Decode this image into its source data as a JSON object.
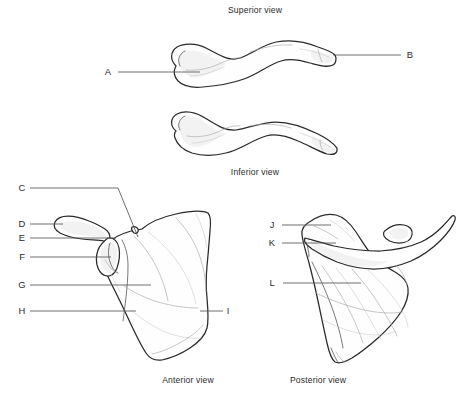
{
  "figure": {
    "background_color": "#ffffff",
    "outline_color": "#2a2a2a",
    "leader_color": "#555555",
    "text_color": "#2b2b2b",
    "width": 462,
    "height": 397
  },
  "captions": {
    "superior": "Superior view",
    "inferior": "Inferior view",
    "anterior": "Anterior view",
    "posterior": "Posterior view"
  },
  "labels": {
    "a": "A",
    "b": "B",
    "c": "C",
    "d": "D",
    "e": "E",
    "f": "F",
    "g": "G",
    "h": "H",
    "i": "I",
    "j": "J",
    "k": "K",
    "l": "L"
  },
  "panels": [
    {
      "id": "superior-clavicle",
      "caption": "Superior view",
      "bone": "clavicle",
      "labels": [
        "A",
        "B"
      ]
    },
    {
      "id": "inferior-clavicle",
      "caption": "Inferior view",
      "bone": "clavicle",
      "labels": []
    },
    {
      "id": "anterior-scapula",
      "caption": "Anterior view",
      "bone": "scapula",
      "labels": [
        "C",
        "D",
        "E",
        "F",
        "G",
        "H",
        "I"
      ]
    },
    {
      "id": "posterior-scapula",
      "caption": "Posterior view",
      "bone": "scapula",
      "labels": [
        "J",
        "K",
        "L"
      ]
    }
  ]
}
